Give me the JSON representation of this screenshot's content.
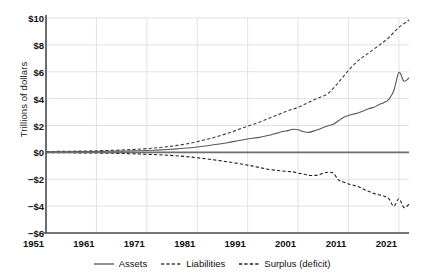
{
  "chart_data": {
    "type": "line",
    "title": "",
    "xlabel": "",
    "ylabel": "Trillions of dollars",
    "xlim": [
      1951,
      2023
    ],
    "ylim": [
      -6,
      10
    ],
    "grid": true,
    "legend_position": "bottom-center",
    "y_ticks": [
      "$10",
      "$8",
      "$6",
      "$4",
      "$2",
      "$0",
      "−$2",
      "−$4",
      "−$6"
    ],
    "y_tick_values": [
      10,
      8,
      6,
      4,
      2,
      0,
      -2,
      -4,
      -6
    ],
    "x_ticks": [
      "1951",
      "1961",
      "1971",
      "1981",
      "1991",
      "2001",
      "2011",
      "2021"
    ],
    "x_tick_values": [
      1951,
      1961,
      1971,
      1981,
      1991,
      2001,
      2011,
      2021
    ],
    "colors": {
      "assets": "#585858",
      "liabilities": "#3c3c3c",
      "surplus": "#1e1e1e",
      "grid": "#e2e2e2",
      "axis": "#4d4d4d",
      "zero_line": "#6e6e6e"
    },
    "series": [
      {
        "name": "Assets",
        "style": "solid",
        "x": [
          1951,
          1953,
          1955,
          1957,
          1959,
          1961,
          1963,
          1965,
          1967,
          1969,
          1971,
          1973,
          1975,
          1977,
          1979,
          1981,
          1983,
          1985,
          1987,
          1989,
          1991,
          1993,
          1995,
          1996,
          1997,
          1998,
          1999,
          2000,
          2001,
          2002,
          2003,
          2004,
          2005,
          2006,
          2007,
          2008,
          2009,
          2010,
          2011,
          2012,
          2013,
          2014,
          2015,
          2016,
          2017,
          2018,
          2019,
          2020,
          2021,
          2022,
          2023
        ],
        "values": [
          0.04,
          0.05,
          0.05,
          0.06,
          0.06,
          0.07,
          0.08,
          0.09,
          0.1,
          0.12,
          0.14,
          0.17,
          0.21,
          0.26,
          0.32,
          0.4,
          0.49,
          0.6,
          0.72,
          0.86,
          1.0,
          1.1,
          1.25,
          1.35,
          1.45,
          1.55,
          1.62,
          1.72,
          1.68,
          1.55,
          1.48,
          1.58,
          1.7,
          1.85,
          1.98,
          2.1,
          2.35,
          2.6,
          2.75,
          2.85,
          2.95,
          3.1,
          3.25,
          3.35,
          3.55,
          3.7,
          3.95,
          4.6,
          5.95,
          5.3,
          5.55
        ],
        "note": "rises slowly then accelerates; dip ~2001-2003, dip ~2008, sharp spike to ~6 in 2021 then pullback"
      },
      {
        "name": "Liabilities",
        "style": "dashed",
        "x": [
          1951,
          1953,
          1955,
          1957,
          1959,
          1961,
          1963,
          1965,
          1967,
          1969,
          1971,
          1973,
          1975,
          1977,
          1979,
          1981,
          1983,
          1985,
          1987,
          1989,
          1991,
          1993,
          1995,
          1997,
          1999,
          2001,
          2003,
          2005,
          2007,
          2009,
          2011,
          2013,
          2015,
          2017,
          2019,
          2021,
          2023
        ],
        "values": [
          0.06,
          0.07,
          0.08,
          0.09,
          0.1,
          0.12,
          0.14,
          0.16,
          0.19,
          0.23,
          0.28,
          0.34,
          0.42,
          0.52,
          0.64,
          0.8,
          0.98,
          1.18,
          1.42,
          1.68,
          1.95,
          2.2,
          2.5,
          2.8,
          3.1,
          3.35,
          3.7,
          4.05,
          4.4,
          5.2,
          6.1,
          6.85,
          7.4,
          7.95,
          8.55,
          9.3,
          9.85
        ],
        "note": "smooth accelerating growth, kink steeper after 2008, ends near $10T"
      },
      {
        "name": "Surplus (deficit)",
        "style": "dashed",
        "x": [
          1951,
          1955,
          1959,
          1963,
          1967,
          1971,
          1975,
          1979,
          1983,
          1987,
          1991,
          1993,
          1995,
          1997,
          1999,
          2000,
          2001,
          2002,
          2003,
          2004,
          2005,
          2006,
          2007,
          2008,
          2009,
          2010,
          2011,
          2012,
          2013,
          2014,
          2015,
          2016,
          2017,
          2018,
          2019,
          2020,
          2021,
          2022,
          2023
        ],
        "values": [
          -0.02,
          -0.03,
          -0.04,
          -0.06,
          -0.09,
          -0.14,
          -0.21,
          -0.32,
          -0.49,
          -0.7,
          -0.95,
          -1.1,
          -1.25,
          -1.35,
          -1.42,
          -1.45,
          -1.55,
          -1.6,
          -1.7,
          -1.72,
          -1.68,
          -1.55,
          -1.48,
          -1.55,
          -2.05,
          -2.2,
          -2.35,
          -2.45,
          -2.55,
          -2.75,
          -2.9,
          -3.05,
          -3.15,
          -3.25,
          -3.45,
          -4.0,
          -3.45,
          -4.1,
          -3.85
        ],
        "note": "mirrors gap between assets and liabilities; plateau ~2004-2007, steep drop after 2008, volatile near -$4T at end"
      }
    ]
  },
  "legend": {
    "items": [
      {
        "label": "Assets",
        "style": "solid"
      },
      {
        "label": "Liabilities",
        "style": "dashed"
      },
      {
        "label": "Surplus (deficit)",
        "style": "dashed"
      }
    ]
  }
}
